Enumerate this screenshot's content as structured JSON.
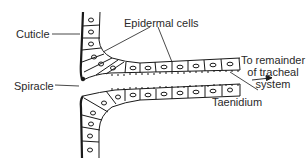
{
  "diagram": {
    "type": "biological-cross-section",
    "colors": {
      "stroke": "#1a1a1a",
      "label": "#2a2a2a",
      "background": "#ffffff"
    },
    "labels": {
      "cuticle": "Cuticle",
      "epidermal_cells": "Epidermal cells",
      "spiracle": "Spiracle",
      "taenidium": "Taenidium",
      "remainder_line1": "To remainder",
      "remainder_line2": "of tracheal",
      "remainder_line3": "system"
    }
  }
}
